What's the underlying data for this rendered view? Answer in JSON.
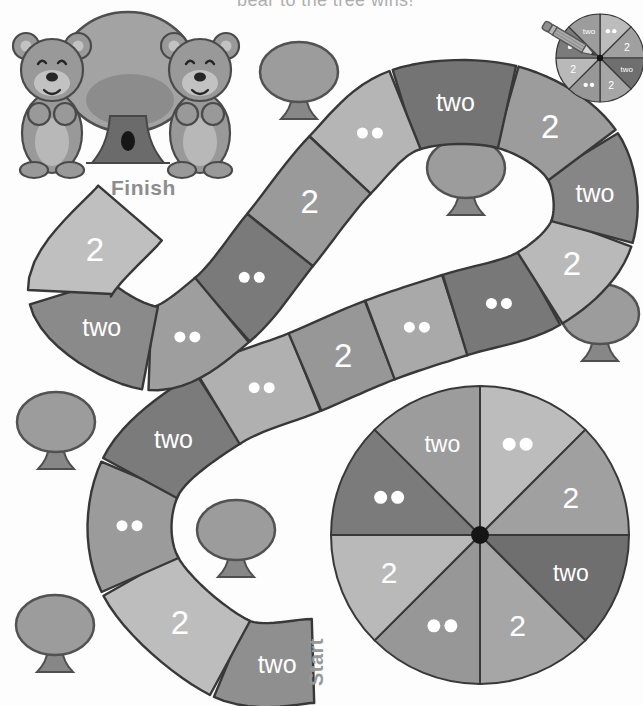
{
  "page": {
    "instruction_text": "bear to the tree wins!",
    "finish_label": "Finish",
    "start_label": "Start"
  },
  "palette": {
    "page_bg": "#fdfdfd",
    "outline": "#383838",
    "label_text": "#ffffff",
    "bear_fur": "#999999",
    "bear_light": "#c2c2c2",
    "tree_canopy": "#9c9c9c",
    "tree_trunk": "#878787",
    "text_gray": "#aeaeae"
  },
  "board": {
    "space_count": 18,
    "spaces": [
      {
        "order": 1,
        "type": "word",
        "label": "two",
        "color": "#8f8f8f"
      },
      {
        "order": 2,
        "type": "numeral",
        "label": "2",
        "color": "#bdbdbd"
      },
      {
        "order": 3,
        "type": "dots",
        "label": "••",
        "color": "#9b9b9b"
      },
      {
        "order": 4,
        "type": "word",
        "label": "two",
        "color": "#7b7b7b"
      },
      {
        "order": 5,
        "type": "dots",
        "label": "••",
        "color": "#b0b0b0"
      },
      {
        "order": 6,
        "type": "numeral",
        "label": "2",
        "color": "#979797"
      },
      {
        "order": 7,
        "type": "dots",
        "label": "••",
        "color": "#a9a9a9"
      },
      {
        "order": 8,
        "type": "dots",
        "label": "••",
        "color": "#787878"
      },
      {
        "order": 9,
        "type": "numeral",
        "label": "2",
        "color": "#b9b9b9"
      },
      {
        "order": 10,
        "type": "word",
        "label": "two",
        "color": "#868686"
      },
      {
        "order": 11,
        "type": "numeral",
        "label": "2",
        "color": "#9c9c9c"
      },
      {
        "order": 12,
        "type": "word",
        "label": "two",
        "color": "#747474"
      },
      {
        "order": 13,
        "type": "dots",
        "label": "••",
        "color": "#b5b5b5"
      },
      {
        "order": 14,
        "type": "numeral",
        "label": "2",
        "color": "#9a9a9a"
      },
      {
        "order": 15,
        "type": "dots",
        "label": "••",
        "color": "#7a7a7a"
      },
      {
        "order": 16,
        "type": "dots",
        "label": "••",
        "color": "#9e9e9e"
      },
      {
        "order": 17,
        "type": "word",
        "label": "two",
        "color": "#8a8a8a"
      },
      {
        "order": 18,
        "type": "numeral",
        "label": "2",
        "color": "#bfbfbf"
      }
    ],
    "waypoints": [
      [
        313,
        661
      ],
      [
        230,
        658
      ],
      [
        140,
        575
      ],
      [
        140,
        478
      ],
      [
        218,
        408
      ],
      [
        305,
        372
      ],
      [
        380,
        340
      ],
      [
        455,
        315
      ],
      [
        540,
        288
      ],
      [
        592,
        232
      ],
      [
        582,
        155
      ],
      [
        507,
        107
      ],
      [
        405,
        110
      ],
      [
        340,
        165
      ],
      [
        280,
        240
      ],
      [
        222,
        310
      ],
      [
        150,
        348
      ],
      [
        70,
        292
      ],
      [
        130,
        213
      ]
    ],
    "half_width": 42
  },
  "spinner_large": {
    "center": [
      480,
      535
    ],
    "radius": 149,
    "segments_clockwise_from_top": [
      {
        "type": "dots",
        "label": "••",
        "color": "#bcbcbc"
      },
      {
        "type": "numeral",
        "label": "2",
        "color": "#a0a0a0"
      },
      {
        "type": "word",
        "label": "two",
        "color": "#6f6f6f"
      },
      {
        "type": "numeral",
        "label": "2",
        "color": "#a6a6a6"
      },
      {
        "type": "dots",
        "label": "••",
        "color": "#979797"
      },
      {
        "type": "numeral",
        "label": "2",
        "color": "#b9b9b9"
      },
      {
        "type": "dots",
        "label": "••",
        "color": "#7b7b7b"
      },
      {
        "type": "word",
        "label": "two",
        "color": "#9c9c9c"
      }
    ]
  },
  "spinner_small": {
    "center": [
      600,
      58
    ],
    "radius": 44,
    "segments_clockwise_from_top": [
      {
        "type": "dots",
        "label": "••",
        "color": "#bcbcbc"
      },
      {
        "type": "numeral",
        "label": "2",
        "color": "#a0a0a0"
      },
      {
        "type": "word",
        "label": "two",
        "color": "#6f6f6f"
      },
      {
        "type": "numeral",
        "label": "2",
        "color": "#a6a6a6"
      },
      {
        "type": "dots",
        "label": "••",
        "color": "#979797"
      },
      {
        "type": "numeral",
        "label": "2",
        "color": "#b9b9b9"
      },
      {
        "type": "dots",
        "label": "••",
        "color": "#7b7b7b"
      },
      {
        "type": "word",
        "label": "two",
        "color": "#9c9c9c"
      }
    ]
  },
  "trees": [
    [
      299,
      72
    ],
    [
      466,
      168
    ],
    [
      600,
      314
    ],
    [
      56,
      422
    ],
    [
      236,
      530
    ],
    [
      55,
      625
    ]
  ]
}
